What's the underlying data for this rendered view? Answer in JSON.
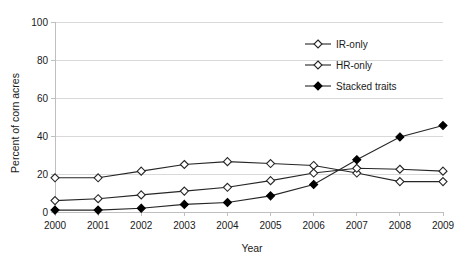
{
  "chart_data": {
    "type": "line",
    "title": "",
    "xlabel": "Year",
    "ylabel": "Percent of corn acres",
    "categories": [
      "2000",
      "2001",
      "2002",
      "2003",
      "2004",
      "2005",
      "2006",
      "2007",
      "2008",
      "2009"
    ],
    "x": [
      2000,
      2001,
      2002,
      2003,
      2004,
      2005,
      2006,
      2007,
      2008,
      2009
    ],
    "xlim": [
      2000,
      2009
    ],
    "ylim": [
      0,
      100
    ],
    "yticks": [
      0,
      20,
      40,
      60,
      80,
      100
    ],
    "ytick_labels": [
      "0",
      "20",
      "40",
      "60",
      "80",
      "100"
    ],
    "grid": "horizontal",
    "legend_position": "upper-right-inside",
    "series": [
      {
        "name": "IR-only",
        "marker": "open-diamond",
        "color": "#262626",
        "values": [
          18,
          18,
          21.5,
          25,
          26.5,
          25.5,
          24.5,
          20.5,
          16,
          16
        ]
      },
      {
        "name": "HR-only",
        "marker": "open-diamond",
        "color": "#262626",
        "values": [
          6,
          7,
          9,
          11,
          13,
          16.5,
          20.5,
          23,
          22.5,
          21.5
        ]
      },
      {
        "name": "Stacked traits",
        "marker": "filled-diamond",
        "color": "#000000",
        "values": [
          1,
          1,
          2,
          4,
          5,
          8.5,
          14.5,
          27.5,
          39.5,
          45.5
        ]
      }
    ]
  },
  "axes": {
    "y_title": "Percent of corn acres",
    "x_title": "Year"
  }
}
